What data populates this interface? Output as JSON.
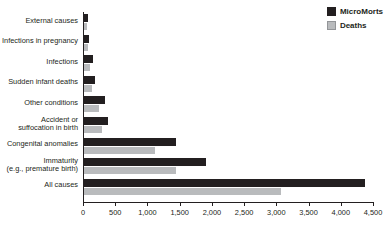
{
  "title": "",
  "legend": {
    "position": "top-right",
    "entries": [
      {
        "label": "MicroMorts",
        "color": "#231f20",
        "swatch": "dark"
      },
      {
        "label": "Deaths",
        "color": "#b9bbbd",
        "swatch": "gray"
      }
    ]
  },
  "axis": {
    "ticks": [
      "0",
      "500",
      "1,000",
      "1,500",
      "2,000",
      "2,500",
      "3,000",
      "3,500",
      "4,000",
      "4,500"
    ],
    "min": 0,
    "max": 4500,
    "step": 500
  },
  "chart_data": {
    "type": "bar",
    "orientation": "horizontal",
    "title": "",
    "xlabel": "",
    "ylabel": "",
    "xlim": [
      0,
      4500
    ],
    "grid": false,
    "legend_position": "top-right",
    "categories": [
      "External causes",
      "Infections in pregnancy",
      "Infections",
      "Sudden infant deaths",
      "Other conditions",
      "Accident or\nsuffocation in birth",
      "Congenital anomalies",
      "Immaturity\n(e.g., premature birth)",
      "All causes"
    ],
    "series": [
      {
        "name": "MicroMorts",
        "color": "#231f20",
        "values": [
          55,
          75,
          135,
          175,
          320,
          380,
          1430,
          1890,
          4360
        ]
      },
      {
        "name": "Deaths",
        "color": "#b9bbbd",
        "values": [
          40,
          55,
          100,
          130,
          235,
          280,
          1100,
          1420,
          3060
        ]
      }
    ]
  }
}
